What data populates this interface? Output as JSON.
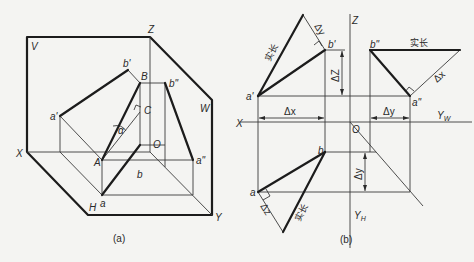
{
  "figure_a": {
    "caption": "(a)",
    "planes": {
      "v": "V",
      "w": "W",
      "h": "H"
    },
    "axes": {
      "x": "X",
      "y": "Y",
      "z": "Z",
      "origin": "O"
    },
    "points": {
      "a_prime": "a'",
      "b_prime": "b'",
      "a_double_prime": "a\"",
      "b_double_prime": "b\"",
      "a": "a",
      "b": "b",
      "A": "A",
      "B": "B",
      "C": "C"
    },
    "angle": "α"
  },
  "figure_b": {
    "caption": "(b)",
    "axes": {
      "x": "X",
      "z": "Z",
      "origin": "O",
      "yw": "Y",
      "yw_sub": "W",
      "yh": "Y",
      "yh_sub": "H"
    },
    "points": {
      "a_prime": "a'",
      "b_prime": "b'",
      "a_double_prime": "a\"",
      "b_double_prime": "b\"",
      "a": "a",
      "b": "b"
    },
    "dimensions": {
      "delta_x_front": "Δx",
      "delta_z": "ΔZ",
      "delta_y_side": "Δy",
      "delta_y_top": "Δy",
      "delta_y_triangle": "Δy",
      "delta_x_triangle": "Δx",
      "delta_z_triangle": "Δz"
    },
    "true_length_labels": {
      "front_view": "实长",
      "side_view": "实长",
      "top_view": "实长"
    }
  }
}
